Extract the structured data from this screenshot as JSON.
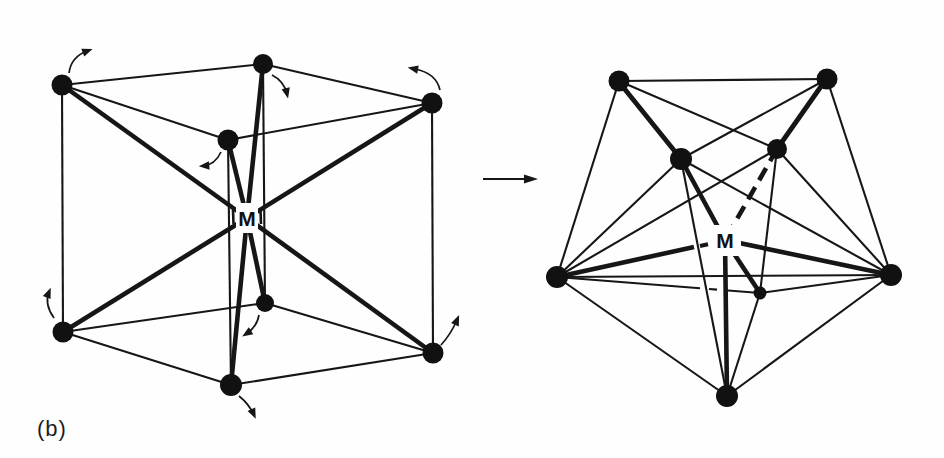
{
  "figure": {
    "caption_label": "(b)",
    "transition_arrow": {
      "from": {
        "x": 483,
        "y": 179
      },
      "to": {
        "x": 524,
        "y": 179
      },
      "head_tip": {
        "x": 538,
        "y": 179
      },
      "head_len": 14,
      "head_halfwidth": 4.5
    },
    "structures": [
      {
        "name": "cubic-ML8",
        "center_label": "M",
        "center": {
          "x": 247,
          "y": 218
        },
        "label_box": {
          "x": 236,
          "y": 203,
          "w": 22,
          "h": 30
        },
        "vertices": [
          {
            "id": "TL",
            "x": 62,
            "y": 85,
            "r": 10.5
          },
          {
            "id": "TB",
            "x": 263,
            "y": 64,
            "r": 10
          },
          {
            "id": "TR",
            "x": 432,
            "y": 103,
            "r": 10.5
          },
          {
            "id": "TF",
            "x": 228,
            "y": 140,
            "r": 10.5
          },
          {
            "id": "BL",
            "x": 63,
            "y": 332,
            "r": 10.5
          },
          {
            "id": "BB",
            "x": 265,
            "y": 303,
            "r": 9
          },
          {
            "id": "BR",
            "x": 433,
            "y": 353,
            "r": 10.5
          },
          {
            "id": "BF",
            "x": 231,
            "y": 385,
            "r": 11
          }
        ],
        "edges": [
          [
            "TL",
            "TB"
          ],
          [
            "TB",
            "TR"
          ],
          [
            "TR",
            "TF"
          ],
          [
            "TF",
            "TL"
          ],
          [
            "BL",
            "BB"
          ],
          [
            "BB",
            "BR"
          ],
          [
            "BR",
            "BF"
          ],
          [
            "BF",
            "BL"
          ],
          [
            "TL",
            "BL"
          ],
          [
            "TB",
            "BB"
          ],
          [
            "TR",
            "BR"
          ],
          [
            "TF",
            "BF"
          ]
        ],
        "thick_edges": [],
        "segments": [],
        "bonds": [
          {
            "to": "TL"
          },
          {
            "to": "TB"
          },
          {
            "to": "TR"
          },
          {
            "to": "TF"
          },
          {
            "to": "BL"
          },
          {
            "to": "BB"
          },
          {
            "to": "BR"
          },
          {
            "to": "BF"
          }
        ],
        "label_dashes": [
          {
            "x1": 233,
            "y1": 210,
            "x2": 233.5,
            "y2": 224,
            "w": 2.6
          },
          {
            "x1": 260.5,
            "y1": 210,
            "x2": 261,
            "y2": 224,
            "w": 2.6
          }
        ],
        "rotation_arrows": [
          {
            "from": {
              "x": 69,
              "y": 73
            },
            "via": {
              "x": 71,
              "y": 57
            },
            "to": {
              "x": 87,
              "y": 51
            }
          },
          {
            "from": {
              "x": 272,
              "y": 75
            },
            "via": {
              "x": 284,
              "y": 81
            },
            "to": {
              "x": 287,
              "y": 94
            }
          },
          {
            "from": {
              "x": 440,
              "y": 90
            },
            "via": {
              "x": 436,
              "y": 73
            },
            "to": {
              "x": 415,
              "y": 69
            }
          },
          {
            "from": {
              "x": 221,
              "y": 152
            },
            "via": {
              "x": 215,
              "y": 165
            },
            "to": {
              "x": 203,
              "y": 166
            }
          },
          {
            "from": {
              "x": 54,
              "y": 318
            },
            "via": {
              "x": 44,
              "y": 304
            },
            "to": {
              "x": 49,
              "y": 292
            }
          },
          {
            "from": {
              "x": 259,
              "y": 315
            },
            "via": {
              "x": 257,
              "y": 327
            },
            "to": {
              "x": 246,
              "y": 334
            }
          },
          {
            "from": {
              "x": 239,
              "y": 396
            },
            "via": {
              "x": 249,
              "y": 404
            },
            "to": {
              "x": 254,
              "y": 415
            }
          },
          {
            "from": {
              "x": 441,
              "y": 345
            },
            "via": {
              "x": 451,
              "y": 334
            },
            "to": {
              "x": 457,
              "y": 320
            }
          }
        ]
      },
      {
        "name": "square-antiprism-ML8",
        "center_label": "M",
        "center": {
          "x": 725,
          "y": 240
        },
        "label_box": {
          "x": 711,
          "y": 225,
          "w": 30,
          "h": 31
        },
        "vertices": [
          {
            "id": "A",
            "x": 619,
            "y": 81,
            "r": 10.5
          },
          {
            "id": "B",
            "x": 827,
            "y": 79,
            "r": 10.5
          },
          {
            "id": "C",
            "x": 681,
            "y": 159,
            "r": 11
          },
          {
            "id": "D",
            "x": 777,
            "y": 149,
            "r": 10
          },
          {
            "id": "E",
            "x": 557,
            "y": 277,
            "r": 11
          },
          {
            "id": "F",
            "x": 891,
            "y": 275,
            "r": 11
          },
          {
            "id": "G",
            "x": 760,
            "y": 293,
            "r": 6.5
          },
          {
            "id": "H",
            "x": 727,
            "y": 396,
            "r": 11
          }
        ],
        "edges": [
          [
            "A",
            "B"
          ],
          [
            "A",
            "C"
          ],
          [
            "A",
            "D"
          ],
          [
            "A",
            "E"
          ],
          [
            "B",
            "C"
          ],
          [
            "B",
            "D"
          ],
          [
            "B",
            "F"
          ],
          [
            "C",
            "E"
          ],
          [
            "C",
            "F"
          ],
          [
            "C",
            "H"
          ],
          [
            "D",
            "E"
          ],
          [
            "D",
            "F"
          ],
          [
            "D",
            "G"
          ],
          [
            "E",
            "F"
          ],
          [
            "E",
            "H"
          ],
          [
            "F",
            "G"
          ],
          [
            "F",
            "H"
          ],
          [
            "G",
            "H"
          ]
        ],
        "thick_edges": [
          {
            "x1": 623,
            "y1": 87,
            "x2": 681,
            "y2": 159
          },
          {
            "x1": 822,
            "y1": 85,
            "x2": 777,
            "y2": 149
          }
        ],
        "segments": [
          {
            "x1": 557,
            "y1": 277,
            "x2": 700,
            "y2": 288.3,
            "w": 2.1
          },
          {
            "x1": 709,
            "y1": 289,
            "x2": 717,
            "y2": 289.6,
            "w": 2.1
          },
          {
            "x1": 725,
            "y1": 290.2,
            "x2": 760,
            "y2": 293,
            "w": 2.1
          }
        ],
        "bonds": [
          {
            "to": "C"
          },
          {
            "to": "D",
            "dashed": true
          },
          {
            "to": "E",
            "end": {
              "x": 694,
              "y": 247
            }
          },
          {
            "to": "F"
          },
          {
            "to": "G"
          },
          {
            "to": "H"
          }
        ],
        "label_dashes": [
          {
            "x1": 700,
            "y1": 246,
            "x2": 708,
            "y2": 244.3,
            "w": 4.2
          }
        ],
        "rotation_arrows": []
      }
    ]
  }
}
